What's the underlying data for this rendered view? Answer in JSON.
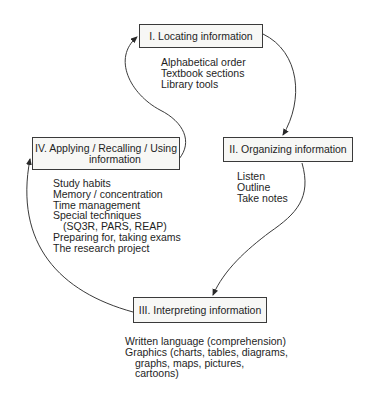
{
  "diagram": {
    "type": "cycle",
    "colors": {
      "line": "#3a3a3a",
      "box_fill": "#f7f7f5",
      "text": "#1e1e1e"
    },
    "stages": [
      {
        "label": "I. Locating information",
        "items": [
          "Alphabetical order",
          "Textbook sections",
          "Library tools"
        ]
      },
      {
        "label": "II. Organizing information",
        "items": [
          "Listen",
          "Outline",
          "Take notes"
        ]
      },
      {
        "label": "III. Interpreting information",
        "items": [
          "Written language (comprehension)",
          "Graphics (charts, tables, diagrams,",
          "graphs, maps, pictures,",
          "cartoons)"
        ]
      },
      {
        "label_line1": "IV.  Applying / Recalling / Using",
        "label_line2": "information",
        "items": [
          "Study habits",
          "Memory / concentration",
          "Time management",
          "Special techniques",
          "(SQ3R, PARS, REAP)",
          "Preparing for, taking exams",
          "The research project"
        ]
      }
    ],
    "flow": [
      "I -> II",
      "II -> III",
      "III -> IV",
      "IV -> I"
    ]
  }
}
